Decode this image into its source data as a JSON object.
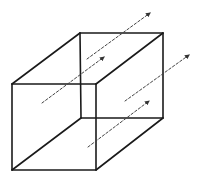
{
  "diagram": {
    "type": "wireframe-cube-with-field-arrows",
    "background": "#ffffff",
    "stroke_color": "#1a1a1a",
    "arrow_color": "#444444",
    "cube": {
      "front_face": {
        "tl": [
          12,
          84
        ],
        "tr": [
          96,
          84
        ],
        "br": [
          96,
          170
        ],
        "bl": [
          12,
          170
        ]
      },
      "back_face": {
        "tl": [
          80,
          33
        ],
        "tr": [
          163,
          33
        ],
        "br": [
          163,
          118
        ],
        "bl": [
          81,
          118
        ]
      }
    },
    "arrows": [
      {
        "id": "arrow-1",
        "from": [
          87,
          59
        ],
        "to": [
          150,
          13
        ]
      },
      {
        "id": "arrow-2",
        "from": [
          42,
          103
        ],
        "to": [
          104,
          57
        ]
      },
      {
        "id": "arrow-3",
        "from": [
          125,
          101
        ],
        "to": [
          189,
          55
        ]
      },
      {
        "id": "arrow-4",
        "from": [
          88,
          147
        ],
        "to": [
          149,
          101
        ]
      }
    ]
  }
}
